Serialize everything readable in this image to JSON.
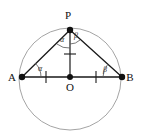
{
  "figure": {
    "type": "geometry-diagram",
    "background_color": "#ffffff",
    "stroke_color": "#1a1a1a",
    "circle_color": "#9a9a9a",
    "points": [
      {
        "id": "P",
        "label": "P",
        "x": 70,
        "y": 30,
        "label_x": 68,
        "label_y": 19,
        "dot": true
      },
      {
        "id": "A",
        "label": "A",
        "x": 22,
        "y": 77,
        "label_x": 12,
        "label_y": 81,
        "dot": true
      },
      {
        "id": "B",
        "label": "B",
        "x": 122,
        "y": 77,
        "label_x": 128,
        "label_y": 81,
        "dot": true
      },
      {
        "id": "O",
        "label": "O",
        "x": 70,
        "y": 77,
        "label_x": 67,
        "label_y": 90,
        "dot": true
      }
    ],
    "circle": {
      "cx": 70,
      "cy": 79,
      "r": 51
    },
    "segments": [
      {
        "id": "AB",
        "from": "A",
        "to": "B"
      },
      {
        "id": "AP",
        "from": "A",
        "to": "P"
      },
      {
        "id": "PB",
        "from": "P",
        "to": "B"
      },
      {
        "id": "PO",
        "from": "P",
        "to": "O"
      }
    ],
    "tick_marks": [
      {
        "id": "tick-AO",
        "on": "AO",
        "x": 46,
        "y": 77
      },
      {
        "id": "tick-OB",
        "on": "OB",
        "x": 96,
        "y": 77
      },
      {
        "id": "tick-PO",
        "on": "PO",
        "x": 70,
        "y": 54
      }
    ],
    "angles": [
      {
        "id": "angle-A",
        "label": "α",
        "vertex": "A",
        "label_x": 40,
        "label_y": 71
      },
      {
        "id": "angle-B",
        "label": "β",
        "vertex": "B",
        "label_x": 104,
        "label_y": 71
      },
      {
        "id": "angle-P-left",
        "label": "α",
        "vertex": "P",
        "label_x": 62,
        "label_y": 41
      },
      {
        "id": "angle-P-right",
        "label": "β",
        "vertex": "P",
        "label_x": 74,
        "label_y": 38
      }
    ]
  }
}
